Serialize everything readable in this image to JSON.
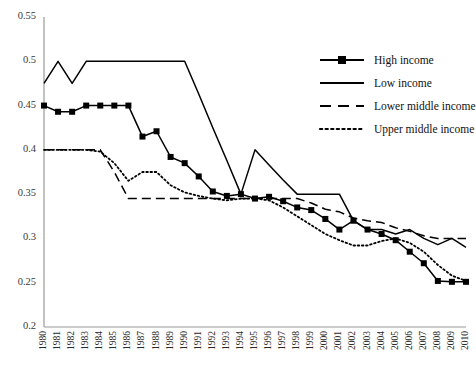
{
  "chart_data": {
    "type": "line",
    "title": "",
    "xlabel": "",
    "ylabel": "",
    "ylim": [
      0.2,
      0.55
    ],
    "ytick_step": 0.05,
    "yticks": [
      "0.55",
      "0.5",
      "0.45",
      "0.4",
      "0.35",
      "0.3",
      "0.25",
      "0.2"
    ],
    "grid": false,
    "legend_position": "top-right",
    "categories": [
      "1980",
      "1981",
      "1982",
      "1983",
      "1984",
      "1985",
      "1986",
      "1987",
      "1988",
      "1989",
      "1990",
      "1991",
      "1992",
      "1993",
      "1994",
      "1995",
      "1996",
      "1997",
      "1998",
      "1999",
      "2000",
      "2001",
      "2002",
      "2003",
      "2004",
      "2005",
      "2006",
      "2007",
      "2008",
      "2009",
      "2010"
    ],
    "series": [
      {
        "name": "High income",
        "style": "solid-markers",
        "marker": "square",
        "values": [
          0.45,
          0.443,
          0.443,
          0.45,
          0.45,
          0.45,
          0.45,
          0.415,
          0.421,
          0.392,
          0.385,
          0.37,
          0.353,
          0.348,
          0.35,
          0.345,
          0.347,
          0.342,
          0.335,
          0.332,
          0.322,
          0.31,
          0.32,
          0.31,
          0.305,
          0.298,
          0.285,
          0.272,
          0.252,
          0.251,
          0.251
        ]
      },
      {
        "name": "Low income",
        "style": "solid",
        "marker": "none",
        "values": [
          0.475,
          0.5,
          0.475,
          0.5,
          0.5,
          0.5,
          0.5,
          0.5,
          0.5,
          0.5,
          0.5,
          0.463,
          0.425,
          0.388,
          0.35,
          0.4,
          0.383,
          0.366,
          0.35,
          0.35,
          0.35,
          0.35,
          0.32,
          0.31,
          0.31,
          0.305,
          0.31,
          0.3,
          0.293,
          0.3,
          0.29
        ]
      },
      {
        "name": "Lower middle income",
        "style": "dashed",
        "marker": "none",
        "values": [
          0.4,
          0.4,
          0.4,
          0.4,
          0.4,
          0.375,
          0.345,
          0.345,
          0.345,
          0.345,
          0.345,
          0.345,
          0.345,
          0.345,
          0.345,
          0.345,
          0.345,
          0.345,
          0.345,
          0.34,
          0.333,
          0.33,
          0.323,
          0.32,
          0.318,
          0.312,
          0.308,
          0.303,
          0.3,
          0.3,
          0.3
        ]
      },
      {
        "name": "Upper middle income",
        "style": "dotted",
        "marker": "none",
        "values": [
          0.4,
          0.4,
          0.4,
          0.4,
          0.398,
          0.385,
          0.365,
          0.375,
          0.375,
          0.36,
          0.352,
          0.348,
          0.345,
          0.343,
          0.345,
          0.345,
          0.343,
          0.335,
          0.325,
          0.315,
          0.305,
          0.298,
          0.292,
          0.292,
          0.297,
          0.3,
          0.295,
          0.285,
          0.27,
          0.258,
          0.252
        ]
      }
    ]
  },
  "legend": {
    "items": [
      {
        "label": "High income",
        "key": "solid-markers"
      },
      {
        "label": "Low income",
        "key": "solid"
      },
      {
        "label": "Lower middle income",
        "key": "dashed"
      },
      {
        "label": "Upper middle income",
        "key": "dotted"
      }
    ]
  },
  "colors": {
    "series": "#000000",
    "axis": "#9a9a9a",
    "tick_text": "#333333"
  }
}
